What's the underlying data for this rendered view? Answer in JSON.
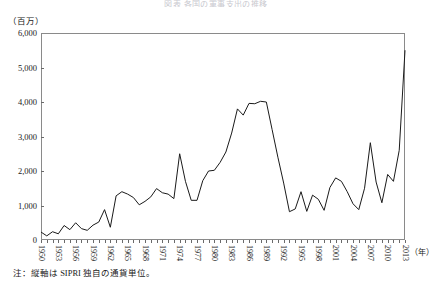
{
  "figure": {
    "title": "図表 各国の軍事支出の推移",
    "y_unit_label": "（百万）",
    "x_unit_label": "（年）",
    "footnote": "注：縦軸は SIPRI 独自の通貨単位。",
    "line_color": "#1a1a1a",
    "frame_color": "#8a8a8a"
  },
  "chart_data": {
    "type": "line",
    "title": "図表 各国の軍事支出の推移",
    "xlabel": "（年）",
    "ylabel": "（百万）",
    "xlim": [
      1950,
      2013
    ],
    "ylim": [
      0,
      6000
    ],
    "grid": false,
    "legend": "none",
    "ytick_labels": [
      "6,000",
      "5,000",
      "4,000",
      "3,000",
      "2,000",
      "1,000",
      "0"
    ],
    "ytick_values": [
      6000,
      5000,
      4000,
      3000,
      2000,
      1000,
      0
    ],
    "xtick_labels": [
      "1950",
      "1953",
      "1956",
      "1959",
      "1962",
      "1965",
      "1968",
      "1971",
      "1974",
      "1977",
      "1980",
      "1983",
      "1986",
      "1989",
      "1992",
      "1995",
      "1998",
      "2001",
      "2004",
      "2007",
      "2010",
      "2013"
    ],
    "xtick_values": [
      1950,
      1953,
      1956,
      1959,
      1962,
      1965,
      1968,
      1971,
      1974,
      1977,
      1980,
      1983,
      1986,
      1989,
      1992,
      1995,
      1998,
      2001,
      2004,
      2007,
      2010,
      2013
    ],
    "x": [
      1950,
      1951,
      1952,
      1953,
      1954,
      1955,
      1956,
      1957,
      1958,
      1959,
      1960,
      1961,
      1962,
      1963,
      1964,
      1965,
      1966,
      1967,
      1968,
      1969,
      1970,
      1971,
      1972,
      1973,
      1974,
      1975,
      1976,
      1977,
      1978,
      1979,
      1980,
      1981,
      1982,
      1983,
      1984,
      1985,
      1986,
      1987,
      1988,
      1989,
      1990,
      1991,
      1992,
      1993,
      1994,
      1995,
      1996,
      1997,
      1998,
      1999,
      2000,
      2001,
      2002,
      2003,
      2004,
      2005,
      2006,
      2007,
      2008,
      2009,
      2010,
      2011,
      2012,
      2013
    ],
    "values": [
      230,
      120,
      240,
      180,
      420,
      300,
      500,
      330,
      280,
      430,
      520,
      880,
      370,
      1280,
      1400,
      1330,
      1230,
      1020,
      1120,
      1250,
      1490,
      1370,
      1330,
      1200,
      2500,
      1700,
      1150,
      1150,
      1720,
      2000,
      2020,
      2250,
      2550,
      3100,
      3800,
      3620,
      3960,
      3950,
      4020,
      4000,
      3200,
      2400,
      1650,
      820,
      900,
      1400,
      830,
      1300,
      1180,
      860,
      1520,
      1800,
      1700,
      1400,
      1050,
      880,
      1500,
      2820,
      1680,
      1080,
      1900,
      1700,
      2600,
      5500
    ]
  }
}
